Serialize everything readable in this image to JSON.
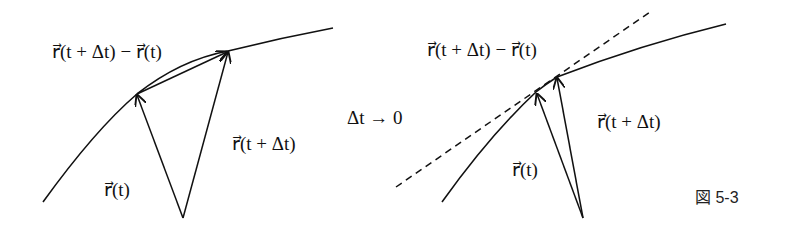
{
  "left_panel": {
    "label_difference": "r⃗(t + Δt) − r⃗(t)",
    "label_r_t_dt": "r⃗(t + Δt)",
    "label_r_t": "r⃗(t)"
  },
  "limit_label": "Δt → 0",
  "right_panel": {
    "label_difference": "r⃗(t + Δt) − r⃗(t)",
    "label_r_t_dt": "r⃗(t + Δt)",
    "label_r_t": "r⃗(t)"
  },
  "figure_caption": "図 5-3",
  "colors": {
    "stroke": "#111111",
    "background": "#ffffff"
  }
}
